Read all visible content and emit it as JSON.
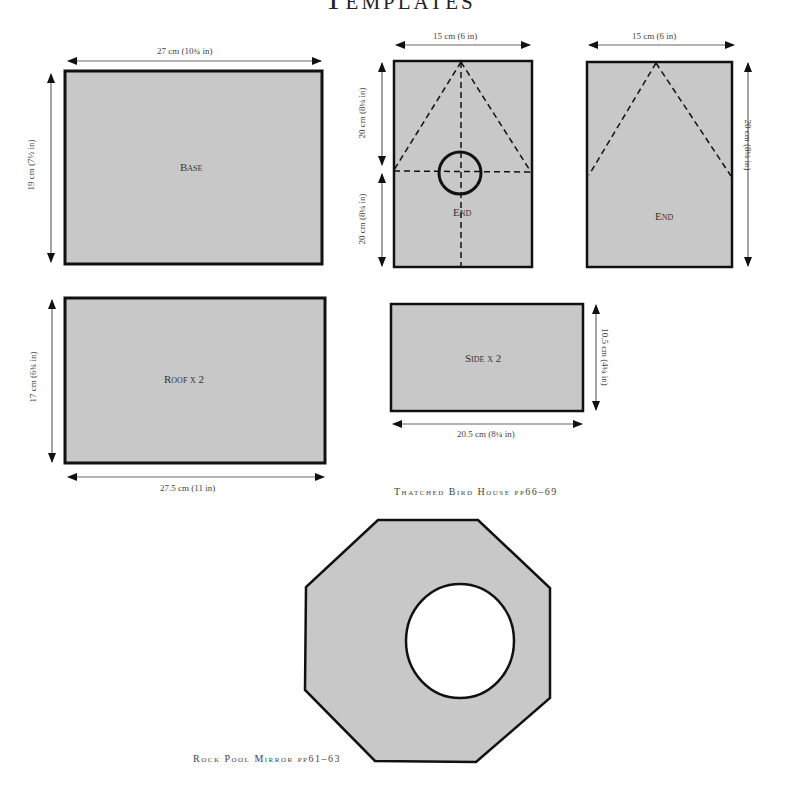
{
  "page": {
    "title": "Templates"
  },
  "templates": {
    "base": {
      "label": "Base",
      "width": "27 cm (10¾ in)",
      "height": "19 cm (7½ in)"
    },
    "roof": {
      "label": "Roof x 2",
      "width": "27.5 cm (11 in)",
      "height": "17 cm (6¾ in)"
    },
    "end_with_hole": {
      "label": "End",
      "width": "15 cm (6 in)",
      "height_top": "20 cm (8¼ in)",
      "height_bottom": "20 cm (8¼ in)"
    },
    "end_plain": {
      "label": "End",
      "width": "15 cm (6 in)",
      "height": "20 cm (8¼ in)"
    },
    "side": {
      "label": "Side x 2",
      "width": "20.5 cm (8¼ in)",
      "height": "10.5 cm (4¼ in)"
    },
    "mirror": {
      "shape": "octagon-with-circular-hole"
    }
  },
  "captions": {
    "bird_house": "Thatched Bird House pp66–69",
    "mirror": "Rock Pool Mirror pp61–63"
  },
  "colors": {
    "fill": "#c8c8c8",
    "stroke": "#111111"
  }
}
